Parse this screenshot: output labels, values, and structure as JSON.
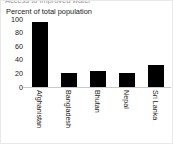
{
  "figure": {
    "clipped_title": "Access to improved water",
    "axis_label": "Percent of total population"
  },
  "chart_data": {
    "type": "bar",
    "title": "",
    "xlabel": "",
    "ylabel": "Percent of total population",
    "categories": [
      "Afghanistan",
      "Bangladesh",
      "Bhutan",
      "Nepal",
      "Sri Lanka"
    ],
    "values": [
      95,
      21,
      24,
      20,
      32
    ],
    "yticks": [
      0,
      20,
      40,
      60,
      80,
      100
    ],
    "ytick_labels": [
      "0",
      "20",
      "40",
      "60",
      "80",
      "100"
    ],
    "ylim": [
      0,
      100
    ],
    "grid": false,
    "legend": null,
    "bar_color": "#000000",
    "background_color": "#ffffff",
    "axis_color": "#c9c9c9",
    "xtick_rotation": 90
  }
}
